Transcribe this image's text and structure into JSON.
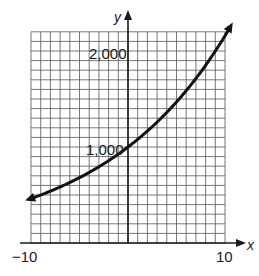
{
  "chart_data": {
    "type": "line",
    "title": "",
    "xlabel": "x",
    "ylabel": "y",
    "xlim": [
      -10,
      10
    ],
    "ylim": [
      0,
      2200
    ],
    "grid": true,
    "grid_x_step": 1,
    "grid_y_step": 100,
    "x_tick_labels": [
      "-10",
      "10"
    ],
    "y_tick_labels": [
      "1,000",
      "2,000"
    ],
    "y_tick_values": [
      1000,
      2000
    ],
    "x_label_display": "−10",
    "x_label_display_right": "10",
    "legend": null,
    "series": [
      {
        "name": "exponential curve",
        "description": "Exponential growth curve through (0, 1000), arrows on both ends",
        "x": [
          -10,
          -8,
          -6,
          -4,
          -2,
          0,
          2,
          4,
          6,
          8,
          10
        ],
        "values": [
          463,
          540,
          630,
          735,
          857,
          1000,
          1166,
          1360,
          1587,
          1851,
          2159
        ]
      }
    ],
    "colors": {
      "curve": "#111111",
      "grid": "#555555",
      "axis": "#1a1a1a"
    }
  },
  "labels": {
    "y_axis": "y",
    "x_axis": "x",
    "y_2000": "2,000",
    "y_1000": "1,000",
    "x_min": "−10",
    "x_max": "10"
  }
}
